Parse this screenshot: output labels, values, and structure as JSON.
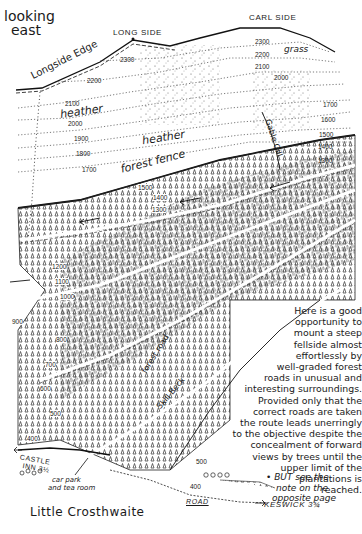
{
  "map": {
    "orientation": [
      "looking",
      "east"
    ],
    "summits": [
      {
        "name": "LONG SIDE"
      },
      {
        "name": "CARL SIDE"
      }
    ],
    "features": {
      "ridge": "Longside Edge",
      "vegetation_heather_1": "heather",
      "vegetation_heather_2": "heather",
      "vegetation_grass": "grass",
      "fence": "forest fence",
      "stream_gill": "Gable Gill",
      "stream_beck": "Skill Beck",
      "track": "forest road",
      "village": "Little Crosthwaite",
      "inn": [
        "CASTLE",
        "INN 3½"
      ],
      "car_park": [
        "car park",
        "and tea room"
      ],
      "road": "ROAD",
      "destination": "KESWICK 3¾"
    },
    "contours_left": [
      "2300",
      "2200",
      "2100",
      "2000",
      "1900",
      "1800",
      "1700"
    ],
    "contours_right": [
      "2300",
      "2200",
      "2100",
      "2000",
      "1700",
      "1600",
      "1500",
      "1400",
      "1300"
    ],
    "contours_forest": [
      "1500",
      "1400",
      "1300",
      "1200",
      "1100",
      "1000",
      "900",
      "800",
      "700",
      "600",
      "500",
      "400"
    ],
    "contours_bottom": [
      "500",
      "400"
    ]
  },
  "description": {
    "lines": [
      "Here is a good",
      "opportunity to",
      "mount a steep",
      "fellside almost",
      "effortlessly by",
      "well-graded forest",
      "roads in unusual and",
      "interesting surroundings.",
      "Provided only that the",
      "correct roads are taken",
      "the route leads unerringly",
      "to the objective despite the",
      "concealment of forward",
      "views by trees until the",
      "upper limit of the",
      "plantations is",
      "reached."
    ],
    "note": [
      "• BUT see the",
      "note on the",
      "opposite page"
    ]
  },
  "colors": {
    "ink": "#1a1a1a",
    "paper": "#ffffff"
  }
}
